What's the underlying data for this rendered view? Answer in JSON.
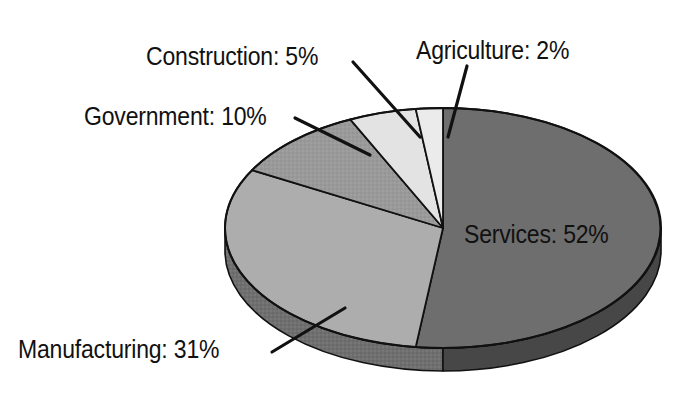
{
  "chart_data": {
    "type": "pie",
    "title": "",
    "subtitle": "",
    "xlabel": "",
    "ylabel": "",
    "legend_position": "none",
    "grid": false,
    "style": "3d-exploded-none",
    "unit": "%",
    "categories": [
      "Agriculture",
      "Services",
      "Manufacturing",
      "Government",
      "Construction"
    ],
    "values": [
      2,
      52,
      31,
      10,
      5
    ],
    "slices": [
      {
        "name": "Agriculture",
        "value": 2,
        "label": "Agriculture: 2%",
        "color": "#ecebeb",
        "side_color": "#b9b8b8",
        "texture": "plain"
      },
      {
        "name": "Services",
        "value": 52,
        "label": "Services: 52%",
        "color": "#6e6e6e",
        "side_color": "#474747",
        "texture": "plain"
      },
      {
        "name": "Manufacturing",
        "value": 31,
        "label": "Manufacturing: 31%",
        "color": "#adadad",
        "side_color": "#6f6f6f",
        "texture": "plain"
      },
      {
        "name": "Government",
        "value": 10,
        "label": "Government: 10%",
        "color": "#9a9a9a",
        "side_color": "#666666",
        "texture": "stipple"
      },
      {
        "name": "Construction",
        "value": 5,
        "label": "Construction: 5%",
        "color": "#e3e3e3",
        "side_color": "#a8a8a8",
        "texture": "plain"
      }
    ],
    "annotations": [
      {
        "text": "Construction: 5%",
        "leader": true
      },
      {
        "text": "Agriculture: 2%",
        "leader": true
      },
      {
        "text": "Government: 10%",
        "leader": true
      },
      {
        "text": "Manufacturing: 31%",
        "leader": true
      },
      {
        "text": "Services: 52%",
        "leader": false
      }
    ]
  },
  "labels": {
    "construction": "Construction: 5%",
    "agriculture": "Agriculture: 2%",
    "government": "Government: 10%",
    "manufacturing": "Manufacturing: 31%",
    "services": "Services: 52%"
  },
  "colors": {
    "background": "#ffffff",
    "outline": "#111111",
    "text": "#111111",
    "agriculture": "#ecebeb",
    "services": "#6e6e6e",
    "manufacturing": "#adadad",
    "government": "#9a9a9a",
    "construction": "#e3e3e3"
  }
}
